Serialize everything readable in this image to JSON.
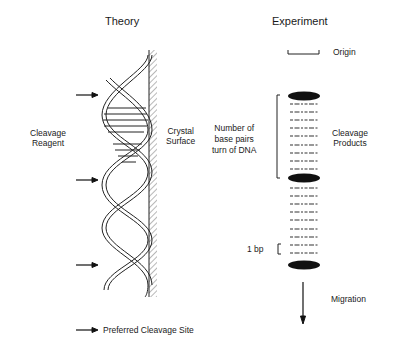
{
  "theory": {
    "title": "Theory",
    "reagent_label_1": "Cleavage",
    "reagent_label_2": "Reagent",
    "surface_label_1": "Crystal",
    "surface_label_2": "Surface"
  },
  "experiment": {
    "title": "Experiment",
    "origin_label": "Origin",
    "bp_label_1": "Number of",
    "bp_label_2": "base pairs",
    "bp_label_3": "turn of DNA",
    "products_label_1": "Cleavage",
    "products_label_2": "Products",
    "one_bp_label": "1 bp",
    "migration_label": "Migration"
  },
  "legend": {
    "label": "Preferred Cleavage Site"
  }
}
